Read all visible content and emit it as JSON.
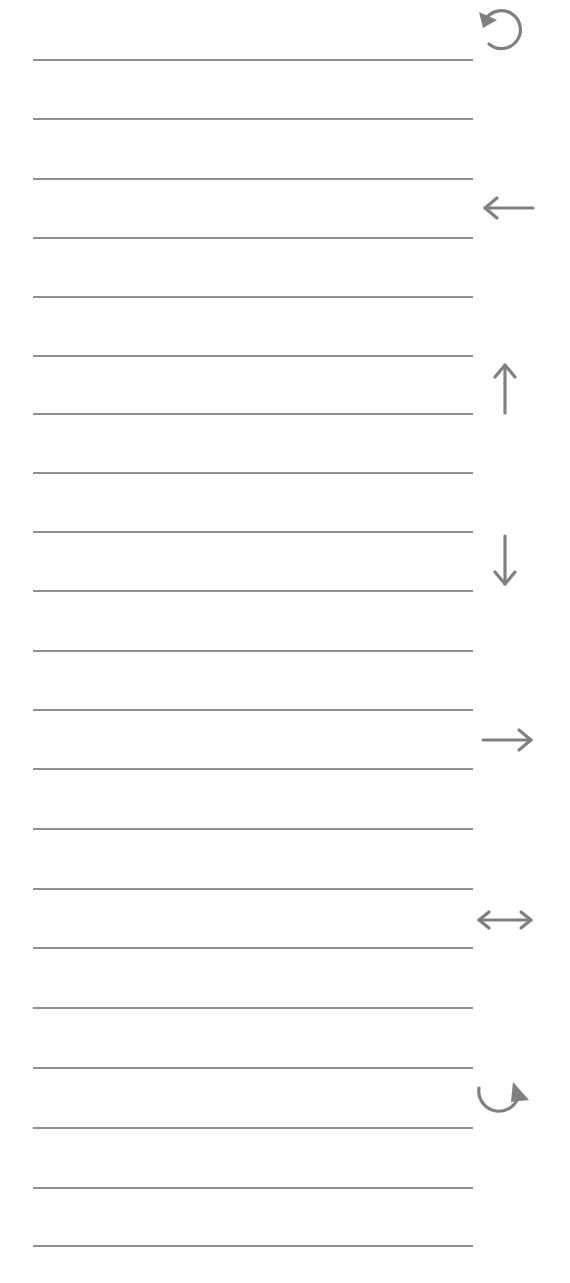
{
  "page": {
    "background": "#ffffff",
    "line_color": "#8f8f8f",
    "icon_color": "#808080"
  },
  "lines": {
    "count": 21,
    "x_start": 33,
    "x_end": 473,
    "y_positions": [
      60,
      119,
      179,
      238,
      297,
      356,
      414,
      473,
      532,
      591,
      651,
      710,
      769,
      829,
      889,
      948,
      1008,
      1068,
      1128,
      1188,
      1246
    ]
  },
  "icons": [
    {
      "name": "rotate-counterclockwise-icon",
      "glyph": "↺",
      "center_x": 503,
      "center_y": 28
    },
    {
      "name": "arrow-left-icon",
      "glyph": "←",
      "center_x": 507,
      "center_y": 208
    },
    {
      "name": "arrow-up-icon",
      "glyph": "↑",
      "center_x": 505,
      "center_y": 389
    },
    {
      "name": "arrow-down-icon",
      "glyph": "↓",
      "center_x": 505,
      "center_y": 560
    },
    {
      "name": "arrow-right-icon",
      "glyph": "→",
      "center_x": 507,
      "center_y": 740
    },
    {
      "name": "arrow-left-right-icon",
      "glyph": "↔",
      "center_x": 505,
      "center_y": 920
    },
    {
      "name": "rotate-clockwise-icon",
      "glyph": "↻",
      "center_x": 503,
      "center_y": 1100
    }
  ]
}
